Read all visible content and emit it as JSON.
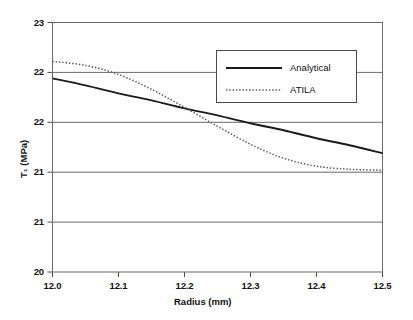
{
  "chart_data": {
    "type": "line",
    "title": "",
    "xlabel": "Radius (mm)",
    "ylabel": "T₁ (MPa)",
    "xlim": [
      12.0,
      12.5
    ],
    "ylim": [
      20.0,
      22.5
    ],
    "grid": true,
    "legend_position": "top-right",
    "xticks": [
      "12.0",
      "12.1",
      "12.2",
      "12.3",
      "12.4",
      "12.5"
    ],
    "xtick_values": [
      12.0,
      12.1,
      12.2,
      12.3,
      12.4,
      12.5
    ],
    "yticks": [
      "23",
      "22",
      "22",
      "21",
      "21",
      "20"
    ],
    "ytick_values": [
      22.5,
      22.0,
      21.5,
      21.0,
      20.5,
      20.0
    ],
    "series": [
      {
        "name": "Analytical",
        "style": "solid",
        "color": "#1a1a1a",
        "x": [
          12.0,
          12.05,
          12.1,
          12.15,
          12.2,
          12.25,
          12.3,
          12.35,
          12.4,
          12.45,
          12.5
        ],
        "y": [
          21.94,
          21.87,
          21.79,
          21.72,
          21.64,
          21.57,
          21.49,
          21.42,
          21.34,
          21.27,
          21.19
        ]
      },
      {
        "name": "ATILA",
        "style": "dotted",
        "color": "#555555",
        "x": [
          12.0,
          12.05,
          12.1,
          12.15,
          12.2,
          12.25,
          12.3,
          12.35,
          12.4,
          12.45,
          12.5
        ],
        "y": [
          22.11,
          22.07,
          21.98,
          21.83,
          21.65,
          21.46,
          21.28,
          21.14,
          21.06,
          21.03,
          21.02
        ]
      }
    ]
  },
  "legend": {
    "items": [
      {
        "label": "Analytical",
        "style": "solid"
      },
      {
        "label": "ATILA",
        "style": "dotted"
      }
    ]
  }
}
